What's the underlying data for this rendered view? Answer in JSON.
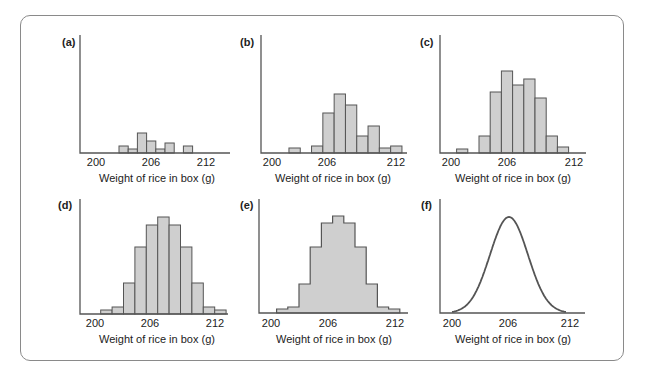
{
  "chart_data": [
    {
      "id": "a",
      "type": "bar",
      "panel_label": "(a)",
      "xlabel": "Weight of rice in box (g)",
      "ylabel": "",
      "xticks": [
        "200",
        "206",
        "212"
      ],
      "xlim": [
        198.3,
        213
      ],
      "bin_edges": [
        202.5,
        203.5,
        204.5,
        205.5,
        206.5,
        207.5,
        208.5,
        209.5,
        210.5
      ],
      "values": [
        7,
        4,
        20,
        12,
        4,
        10,
        0,
        7
      ]
    },
    {
      "id": "b",
      "type": "bar",
      "panel_label": "(b)",
      "xlabel": "Weight of rice in box (g)",
      "ylabel": "",
      "xticks": [
        "200",
        "206",
        "212"
      ],
      "xlim": [
        198.3,
        213
      ],
      "bins": [
        {
          "x0": 201.5,
          "x1": 202.5,
          "h": 5
        },
        {
          "x0": 203.5,
          "x1": 204.5,
          "h": 7
        },
        {
          "x0": 204.5,
          "x1": 205.5,
          "h": 40
        },
        {
          "x0": 205.5,
          "x1": 206.5,
          "h": 59
        },
        {
          "x0": 206.5,
          "x1": 207.5,
          "h": 48
        },
        {
          "x0": 207.5,
          "x1": 208.5,
          "h": 17
        },
        {
          "x0": 208.5,
          "x1": 209.5,
          "h": 27
        },
        {
          "x0": 209.5,
          "x1": 210.5,
          "h": 5
        },
        {
          "x0": 210.5,
          "x1": 211.5,
          "h": 7
        }
      ]
    },
    {
      "id": "c",
      "type": "bar",
      "panel_label": "(c)",
      "xlabel": "Weight of rice in box (g)",
      "ylabel": "",
      "xticks": [
        "200",
        "206",
        "212"
      ],
      "xlim": [
        198.3,
        213
      ],
      "bins": [
        {
          "x0": 200.5,
          "x1": 201.5,
          "h": 4
        },
        {
          "x0": 202.5,
          "x1": 203.5,
          "h": 17
        },
        {
          "x0": 203.5,
          "x1": 204.5,
          "h": 61
        },
        {
          "x0": 204.5,
          "x1": 205.5,
          "h": 82
        },
        {
          "x0": 205.5,
          "x1": 206.5,
          "h": 68
        },
        {
          "x0": 206.5,
          "x1": 207.5,
          "h": 74
        },
        {
          "x0": 207.5,
          "x1": 208.5,
          "h": 55
        },
        {
          "x0": 208.5,
          "x1": 209.5,
          "h": 17
        },
        {
          "x0": 209.5,
          "x1": 210.5,
          "h": 6
        }
      ]
    },
    {
      "id": "d",
      "type": "bar",
      "panel_label": "(d)",
      "xlabel": "Weight of rice in box (g)",
      "ylabel": "",
      "xticks": [
        "200",
        "206",
        "212"
      ],
      "xlim": [
        198.3,
        213
      ],
      "bin_edges": [
        200.5,
        201.5,
        202.5,
        203.5,
        204.5,
        205.5,
        206.5,
        207.5,
        208.5,
        209.5,
        210.5,
        211.5
      ],
      "values": [
        4,
        7,
        31,
        67,
        89,
        97,
        89,
        67,
        31,
        7,
        4
      ]
    },
    {
      "id": "e",
      "type": "area",
      "panel_label": "(e)",
      "xlabel": "Weight of rice in box (g)",
      "ylabel": "",
      "xticks": [
        "200",
        "206",
        "212"
      ],
      "xlim": [
        198.3,
        213
      ],
      "bin_edges": [
        200.5,
        201.5,
        202.5,
        203.5,
        204.5,
        205.5,
        206.5,
        207.5,
        208.5,
        209.5,
        210.5,
        211.5
      ],
      "values": [
        4,
        6,
        29,
        66,
        90,
        97,
        90,
        66,
        29,
        6,
        4
      ]
    },
    {
      "id": "f",
      "type": "line",
      "panel_label": "(f)",
      "xlabel": "Weight of rice in box (g)",
      "ylabel": "",
      "xticks": [
        "200",
        "206",
        "212"
      ],
      "xlim": [
        198.8,
        213
      ],
      "curve": "normal",
      "mean": 206,
      "sd": 2,
      "peak": 96,
      "x_range": [
        200,
        212
      ]
    }
  ]
}
